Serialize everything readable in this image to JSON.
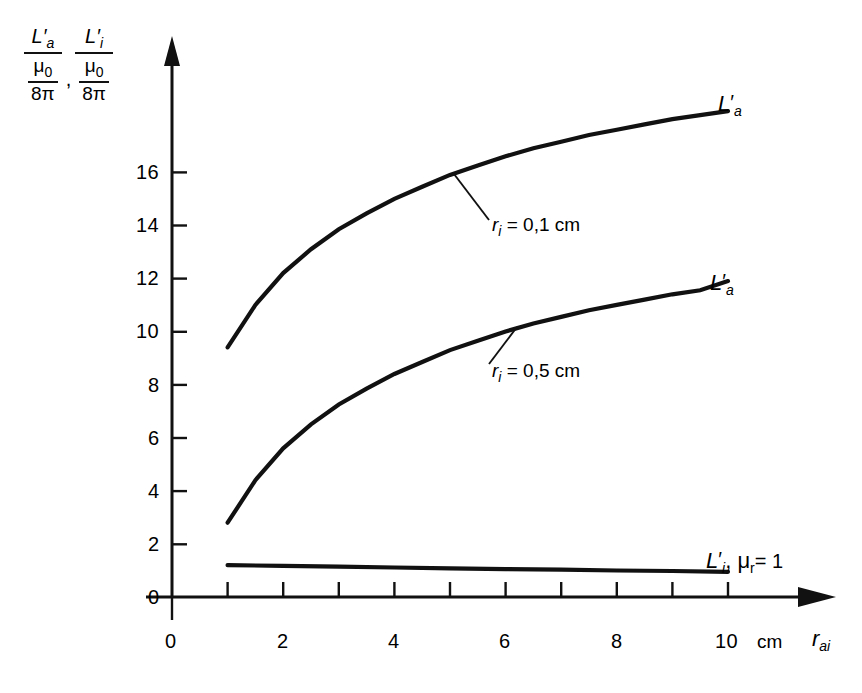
{
  "chart_data": {
    "type": "line",
    "title": "",
    "xlabel": "r_ai",
    "xlabel_unit": "cm",
    "ylabel": "L'a / (mu0/8pi) , L'i / (mu0/8pi)",
    "xlim": [
      0,
      11.2
    ],
    "ylim": [
      0,
      18.8
    ],
    "xticks": [
      0,
      1,
      2,
      3,
      4,
      5,
      6,
      7,
      8,
      9,
      10
    ],
    "xticklabels": [
      "0",
      "",
      "2",
      "",
      "4",
      "",
      "6",
      "",
      "8",
      "",
      "10"
    ],
    "yticks": [
      0,
      2,
      4,
      6,
      8,
      10,
      12,
      14,
      16
    ],
    "yticklabels": [
      "0",
      "2",
      "4",
      "6",
      "8",
      "10",
      "12",
      "14",
      "16"
    ],
    "grid": false,
    "legend": "inline-labels",
    "series": [
      {
        "name": "L'a",
        "annotation": "r_i = 0,1 cm",
        "x": [
          1,
          1.5,
          2,
          2.5,
          3,
          3.5,
          4,
          4.5,
          5,
          5.5,
          6,
          6.5,
          7,
          7.5,
          8,
          8.5,
          9,
          9.5,
          10
        ],
        "y": [
          9.4,
          11.0,
          12.2,
          13.1,
          13.85,
          14.45,
          15.0,
          15.45,
          15.9,
          16.25,
          16.6,
          16.9,
          17.15,
          17.4,
          17.6,
          17.8,
          18.0,
          18.15,
          18.3
        ]
      },
      {
        "name": "L'a",
        "annotation": "r_i = 0,5 cm",
        "x": [
          1,
          1.5,
          2,
          2.5,
          3,
          3.5,
          4,
          4.5,
          5,
          5.5,
          6,
          6.5,
          7,
          7.5,
          8,
          8.5,
          9,
          9.5,
          10
        ],
        "y": [
          2.8,
          4.4,
          5.6,
          6.5,
          7.25,
          7.85,
          8.4,
          8.85,
          9.3,
          9.65,
          10.0,
          10.3,
          10.55,
          10.8,
          11.0,
          11.2,
          11.4,
          11.55,
          11.9
        ]
      },
      {
        "name": "L'i , mu_r = 1",
        "annotation": "",
        "x": [
          1,
          2,
          3,
          4,
          5,
          6,
          7,
          8,
          9,
          10
        ],
        "y": [
          1.2,
          1.17,
          1.14,
          1.11,
          1.08,
          1.05,
          1.03,
          1.0,
          0.98,
          0.95
        ]
      }
    ]
  },
  "ylabel_parts": {
    "num1": "L",
    "num1_prime": "′",
    "num1_sub": "a",
    "den_num": "μ",
    "den_num_sub": "0",
    "den_den": "8π",
    "comma": ",",
    "num2": "L",
    "num2_prime": "′",
    "num2_sub": "i"
  },
  "xaxis": {
    "labels": [
      "0",
      "2",
      "4",
      "6",
      "8",
      "10"
    ],
    "unit": "cm",
    "var": "r",
    "var_sub": "ai"
  },
  "yaxis": {
    "labels": [
      "16",
      "14",
      "12",
      "10",
      "8",
      "6",
      "4",
      "2",
      "0"
    ]
  },
  "series_labels": {
    "top": {
      "base": "L",
      "prime": "′",
      "sub": "a"
    },
    "middle": {
      "base": "L",
      "prime": "′",
      "sub": "a"
    },
    "bottom": {
      "base": "L",
      "prime": "′",
      "sub": "i",
      "tail_comma": ",",
      "mu": "μ",
      "mu_sub": "r",
      "eq": "= 1"
    }
  },
  "annotations": {
    "top": {
      "var": "r",
      "sub": "i",
      "rest": "= 0,1 cm"
    },
    "middle": {
      "var": "r",
      "sub": "i",
      "rest": "= 0,5 cm"
    }
  }
}
